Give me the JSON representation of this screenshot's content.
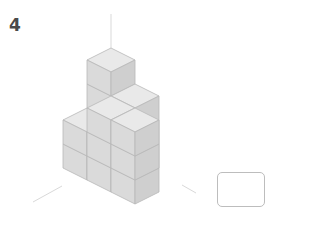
{
  "question": {
    "number": "4"
  },
  "figure": {
    "colors": {
      "top": "#e9e9e9",
      "left": "#dadada",
      "right": "#cfcfcf",
      "edge": "#b8b8b8",
      "axis": "#d6d6d6"
    }
  },
  "answer_box": {
    "value": ""
  }
}
